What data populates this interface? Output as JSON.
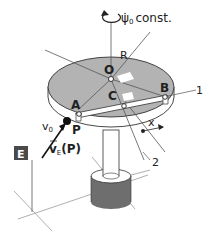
{
  "diagram": {
    "rotation_label": "ψ̇",
    "rotation_sub": "0",
    "rotation_const": "const.",
    "radius_label": "R",
    "center_label": "O",
    "point_a": "A",
    "point_b": "B",
    "point_c": "C",
    "callout_1": "1",
    "callout_2": "2",
    "offset_label": "x",
    "frame_label": "E",
    "velocity_label": "v",
    "velocity_sub": "0",
    "point_p": "P",
    "ve_label": "v",
    "ve_sub": "E",
    "ve_arg": "(P)",
    "colors": {
      "disk_top": "#b3b3b3",
      "disk_rim": "#ffffff",
      "base": "#6e6e6e",
      "flag": "#4a4a4a",
      "line": "#333333",
      "guide": "#999999"
    }
  }
}
